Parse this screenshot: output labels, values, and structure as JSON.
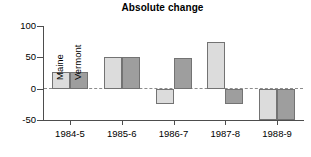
{
  "chart_data": {
    "type": "bar",
    "title": "Absolute change",
    "xlabel": "",
    "ylabel": "",
    "ylim": [
      -50,
      100
    ],
    "yticks": [
      100,
      50,
      0,
      -50
    ],
    "ytick_labels": [
      "100",
      "50",
      "0",
      "-50"
    ],
    "grid": false,
    "zero_line": true,
    "legend": "in-plot rotated labels on first bar pair",
    "categories": [
      "1984-5",
      "1985-6",
      "1986-7",
      "1987-8",
      "1988-9"
    ],
    "series": [
      {
        "name": "Maine",
        "color": "#dcdcdc",
        "values": [
          27,
          50,
          -25,
          75,
          -50
        ]
      },
      {
        "name": "Vermont",
        "color": "#9e9e9e",
        "values": [
          27,
          50,
          49,
          -25,
          -50
        ]
      }
    ]
  },
  "colors": {
    "maine": "#dcdcdc",
    "vermont": "#9e9e9e",
    "bar_border": "#737373",
    "axis": "#4d4d4d",
    "zero_line": "#8c8c8c",
    "background": "#ffffff",
    "text": "#000000"
  }
}
